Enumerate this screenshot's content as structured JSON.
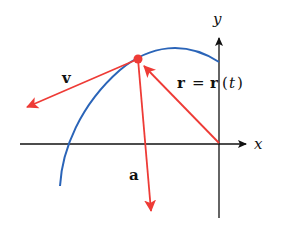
{
  "diagram": {
    "type": "vector-diagram",
    "axes": {
      "x_label": "x",
      "y_label": "y"
    },
    "vectors": {
      "velocity_label": "v",
      "acceleration_label": "a",
      "position_label_lhs": "r",
      "position_label_eq": "=",
      "position_label_rhs_r": "r",
      "position_label_paren_open": "(",
      "position_label_t": "t",
      "position_label_paren_close": ")"
    },
    "colors": {
      "vector": "#ee3b36",
      "curve": "#2a64b8",
      "axis": "#111111"
    }
  }
}
